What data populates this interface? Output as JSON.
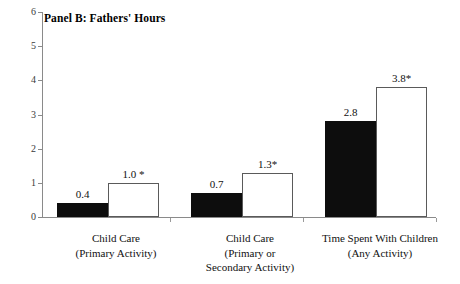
{
  "chart_data": {
    "type": "bar",
    "title": "Panel B: Fathers' Hours",
    "xlabel": "",
    "ylabel": "",
    "ylim": [
      0,
      6
    ],
    "yticks": [
      0,
      1,
      2,
      3,
      4,
      5,
      6
    ],
    "ytick_labels": [
      "0",
      "1",
      "2",
      "3",
      "4",
      "5",
      "6"
    ],
    "grid": false,
    "legend": "none",
    "categories": [
      "Child Care (Primary Activity)",
      "Child Care (Primary or Secondary Activity)",
      "Time Spent With Children (Any Activity)"
    ],
    "category_lines": [
      [
        "Child Care",
        "(Primary Activity)"
      ],
      [
        "Child Care",
        "(Primary or",
        "Secondary Activity)"
      ],
      [
        "Time Spent With Children",
        "(Any Activity)"
      ]
    ],
    "series": [
      {
        "name": "filled",
        "style": "black-filled",
        "values": [
          0.4,
          0.7,
          2.8
        ],
        "labels": [
          "0.4",
          "0.7",
          "2.8"
        ]
      },
      {
        "name": "hollow",
        "style": "white-outlined",
        "values": [
          1.0,
          1.3,
          3.8
        ],
        "labels": [
          "1.0 *",
          "1.3*",
          "3.8*"
        ]
      }
    ],
    "colors": {
      "filled_bar": "#0d0d0d",
      "hollow_bar_fill": "#ffffff",
      "hollow_bar_border": "#5a5a5a",
      "axis": "#8a8a8a",
      "text": "#111111",
      "background": "#ffffff"
    }
  }
}
